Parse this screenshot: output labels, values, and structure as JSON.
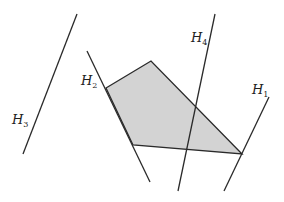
{
  "diagram": {
    "type": "halfplanes-polygon",
    "colors": {
      "line": "#2a2a2a",
      "fill": "#d3d3d3",
      "background": "#ffffff"
    },
    "polygon": {
      "points": "106,88 151,61 242,154 133,145"
    },
    "lines": [
      {
        "id": "H1",
        "x1": 269,
        "y1": 97,
        "x2": 224,
        "y2": 191
      },
      {
        "id": "H2",
        "x1": 87,
        "y1": 51,
        "x2": 150,
        "y2": 182
      },
      {
        "id": "H3",
        "x1": 77,
        "y1": 14,
        "x2": 23,
        "y2": 154
      },
      {
        "id": "H4",
        "x1": 215,
        "y1": 14,
        "x2": 178,
        "y2": 191
      }
    ],
    "labels": [
      {
        "id": "H1",
        "main": "H",
        "sub": "1"
      },
      {
        "id": "H2",
        "main": "H",
        "sub": "2"
      },
      {
        "id": "H3",
        "main": "H",
        "sub": "3"
      },
      {
        "id": "H4",
        "main": "H",
        "sub": "4"
      }
    ]
  }
}
